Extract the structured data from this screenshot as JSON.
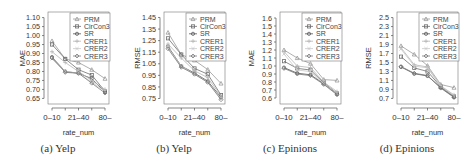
{
  "chart_data": [
    {
      "type": "line",
      "caption": "(a) Yelp",
      "xlabel": "rate_num",
      "ylabel": "MAE",
      "categories": [
        "0-10",
        "11-20",
        "21-40",
        "41-80",
        "80-"
      ],
      "tick_labels": [
        "0-10",
        "",
        "21-40",
        "",
        "80-"
      ],
      "yticks": [
        0.65,
        0.7,
        0.75,
        0.8,
        0.85,
        0.9,
        0.95,
        1.0,
        1.05,
        1.1
      ],
      "ylim": [
        0.63,
        1.12
      ],
      "legend_position": "top-right",
      "series": [
        {
          "name": "PRM",
          "values": [
            0.97,
            0.87,
            0.85,
            0.81,
            0.76
          ]
        },
        {
          "name": "CirCon3",
          "values": [
            0.95,
            0.87,
            0.81,
            0.78,
            0.69
          ]
        },
        {
          "name": "SR",
          "values": [
            0.88,
            0.8,
            0.79,
            0.76,
            0.685
          ]
        },
        {
          "name": "CRER1",
          "values": [
            0.91,
            0.85,
            0.8,
            0.75,
            0.7
          ]
        },
        {
          "name": "CRER2",
          "values": [
            0.87,
            0.8,
            0.79,
            0.74,
            0.69
          ]
        },
        {
          "name": "CRER3",
          "values": [
            0.875,
            0.795,
            0.79,
            0.735,
            0.68
          ]
        }
      ]
    },
    {
      "type": "line",
      "caption": "(b) Yelp",
      "xlabel": "rate_num",
      "ylabel": "RMSE",
      "categories": [
        "0-10",
        "11-20",
        "21-40",
        "41-80",
        "80-"
      ],
      "tick_labels": [
        "0-10",
        "",
        "21-40",
        "",
        "80-"
      ],
      "yticks": [
        0.75,
        0.85,
        0.95,
        1.05,
        1.15,
        1.25,
        1.35,
        1.45
      ],
      "ylim": [
        0.72,
        1.48
      ],
      "legend_position": "top-right",
      "series": [
        {
          "name": "PRM",
          "values": [
            1.32,
            1.13,
            1.08,
            1.0,
            0.88
          ]
        },
        {
          "name": "CirCon3",
          "values": [
            1.27,
            1.13,
            1.01,
            0.96,
            0.78
          ]
        },
        {
          "name": "SR",
          "values": [
            1.2,
            1.03,
            0.97,
            0.9,
            0.76
          ]
        },
        {
          "name": "CRER1",
          "values": [
            1.22,
            1.1,
            0.99,
            0.93,
            0.77
          ]
        },
        {
          "name": "CRER2",
          "values": [
            1.19,
            1.03,
            0.96,
            0.89,
            0.75
          ]
        },
        {
          "name": "CRER3",
          "values": [
            1.18,
            1.02,
            0.96,
            0.89,
            0.74
          ]
        }
      ]
    },
    {
      "type": "line",
      "caption": "(c) Epinions",
      "xlabel": "rate_num",
      "ylabel": "MAE",
      "categories": [
        "0-10",
        "11-20",
        "21-40",
        "41-80",
        "80-"
      ],
      "tick_labels": [
        "0-10",
        "",
        "21-40",
        "",
        "80-"
      ],
      "yticks": [
        0.6,
        0.7,
        0.8,
        0.9,
        1.0,
        1.1,
        1.2,
        1.3,
        1.4,
        1.5,
        1.6
      ],
      "ylim": [
        0.55,
        1.65
      ],
      "legend_position": "top-right",
      "series": [
        {
          "name": "PRM",
          "values": [
            1.2,
            1.1,
            1.03,
            0.83,
            0.82
          ]
        },
        {
          "name": "CirCon3",
          "values": [
            1.06,
            0.97,
            0.95,
            0.79,
            0.66
          ]
        },
        {
          "name": "SR",
          "values": [
            0.98,
            0.91,
            0.89,
            0.78,
            0.65
          ]
        },
        {
          "name": "CRER1",
          "values": [
            1.18,
            1.0,
            0.98,
            0.8,
            0.68
          ]
        },
        {
          "name": "CRER2",
          "values": [
            1.15,
            0.95,
            0.93,
            0.78,
            0.66
          ]
        },
        {
          "name": "CRER3",
          "values": [
            0.97,
            0.9,
            0.88,
            0.77,
            0.64
          ]
        }
      ]
    },
    {
      "type": "line",
      "caption": "(d) Epinions",
      "xlabel": "rate_num",
      "ylabel": "RMSE",
      "categories": [
        "0-10",
        "11-20",
        "21-40",
        "41-80",
        "80-"
      ],
      "tick_labels": [
        "0-10",
        "",
        "21-40",
        "",
        "80-"
      ],
      "yticks": [
        0.7,
        0.9,
        1.1,
        1.3,
        1.5,
        1.7,
        1.9,
        2.1,
        2.3,
        2.5
      ],
      "ylim": [
        0.62,
        2.58
      ],
      "legend_position": "top-right",
      "series": [
        {
          "name": "PRM",
          "values": [
            1.87,
            1.68,
            1.43,
            1.01,
            0.94
          ]
        },
        {
          "name": "CirCon3",
          "values": [
            1.63,
            1.38,
            1.3,
            0.96,
            0.75
          ]
        },
        {
          "name": "SR",
          "values": [
            1.4,
            1.25,
            1.2,
            0.94,
            0.73
          ]
        },
        {
          "name": "CRER1",
          "values": [
            1.83,
            1.45,
            1.4,
            0.98,
            0.78
          ]
        },
        {
          "name": "CRER2",
          "values": [
            1.8,
            1.42,
            1.38,
            0.97,
            0.76
          ]
        },
        {
          "name": "CRER3",
          "values": [
            1.41,
            1.26,
            1.21,
            0.93,
            0.72
          ]
        }
      ]
    }
  ],
  "series_styles": [
    {
      "color": "#9a9a9a",
      "marker": "triangle"
    },
    {
      "color": "#6e6e6e",
      "marker": "square"
    },
    {
      "color": "#555555",
      "marker": "circle"
    },
    {
      "color": "#b5b5b5",
      "marker": "plus"
    },
    {
      "color": "#c8c8c8",
      "marker": "cross"
    },
    {
      "color": "#7a7a7a",
      "marker": "diamond"
    }
  ]
}
